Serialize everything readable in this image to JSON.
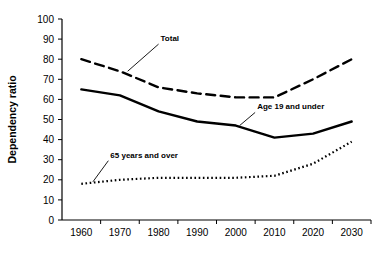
{
  "chart_data": {
    "type": "line",
    "title": "",
    "xlabel": "",
    "ylabel": "Dependency ratio",
    "x": [
      1960,
      1970,
      1980,
      1990,
      2000,
      2010,
      2020,
      2030
    ],
    "xticklabels": [
      "1960",
      "1970",
      "1980",
      "1990",
      "2000",
      "2010",
      "2020",
      "2030"
    ],
    "yticklabels": [
      "0",
      "10",
      "20",
      "30",
      "40",
      "50",
      "60",
      "70",
      "80",
      "90",
      "100"
    ],
    "yticks": [
      0,
      10,
      20,
      30,
      40,
      50,
      60,
      70,
      80,
      90,
      100
    ],
    "xlim": [
      1955,
      2035
    ],
    "ylim": [
      0,
      100
    ],
    "grid": false,
    "legend_position": "inline-annotations",
    "series": [
      {
        "name": "Total",
        "style": "dashed",
        "color": "#000000",
        "values": [
          80,
          74,
          66,
          63,
          61,
          61,
          70,
          80
        ]
      },
      {
        "name": "Age 19 and under",
        "style": "solid",
        "color": "#000000",
        "values": [
          65,
          62,
          54,
          49,
          47,
          41,
          43,
          49
        ]
      },
      {
        "name": "65 years and over",
        "style": "dotted",
        "color": "#000000",
        "values": [
          18,
          20,
          21,
          21,
          21,
          22,
          28,
          39
        ]
      }
    ],
    "annotations": [
      {
        "text": "Total",
        "series": "Total",
        "point_x": 1972,
        "point_y": 74,
        "label_x": 1980,
        "label_y": 89
      },
      {
        "text": "Age 19 and under",
        "series": "Age 19 and under",
        "point_x": 2001,
        "point_y": 47,
        "label_x": 2005,
        "label_y": 55
      },
      {
        "text": "65 years and over",
        "series": "65 years and over",
        "point_x": 1963,
        "point_y": 19,
        "label_x": 1967,
        "label_y": 31
      }
    ]
  }
}
